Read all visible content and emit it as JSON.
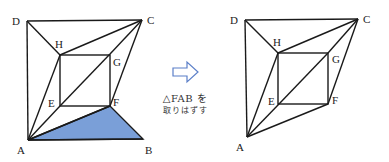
{
  "left_figure": {
    "points": {
      "A": [
        28,
        140
      ],
      "B": [
        143,
        139
      ],
      "C": [
        142,
        20
      ],
      "D": [
        27,
        21
      ],
      "E": [
        60,
        106
      ],
      "F": [
        110,
        106
      ],
      "G": [
        110,
        54
      ],
      "H": [
        60,
        55
      ]
    },
    "labels": {
      "A": "A",
      "B": "B",
      "C": "C",
      "D": "D",
      "E": "E",
      "F": "F",
      "G": "G",
      "H": "H"
    },
    "shaded_triangle": "FAB",
    "shade_color": "#7a9fd8"
  },
  "arrow": {
    "icon": "right-arrow-icon",
    "color": "#5b7fc8"
  },
  "caption": {
    "line1": "△FAB を",
    "line2": "取りはずす"
  },
  "right_figure": {
    "labels": {
      "A": "A",
      "C": "C",
      "D": "D",
      "E": "E",
      "F": "F",
      "G": "G",
      "H": "H"
    }
  }
}
